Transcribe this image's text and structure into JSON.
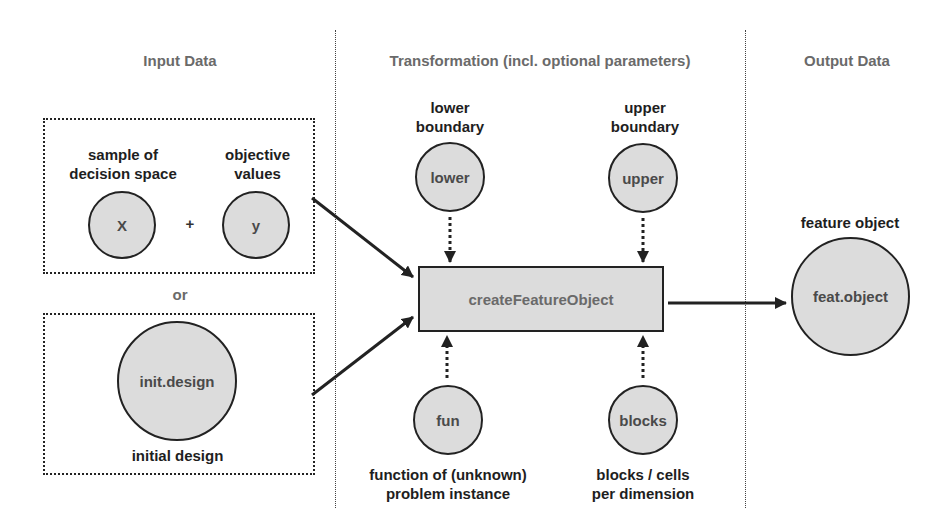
{
  "columns": {
    "input": {
      "heading": "Input Data"
    },
    "transformation": {
      "heading": "Transformation (incl. optional parameters)"
    },
    "output": {
      "heading": "Output Data"
    }
  },
  "input": {
    "option_a": {
      "x_label": "sample of\ndecision space",
      "x_node": "X",
      "plus": "+",
      "y_label": "objective\nvalues",
      "y_node": "y"
    },
    "or_label": "or",
    "option_b": {
      "node": "init.design",
      "label": "initial design"
    }
  },
  "transformation": {
    "function_box": "createFeatureObject",
    "params": {
      "lower": {
        "label": "lower\nboundary",
        "node": "lower"
      },
      "upper": {
        "label": "upper\nboundary",
        "node": "upper"
      },
      "fun": {
        "label": "function of (unknown)\nproblem instance",
        "node": "fun"
      },
      "blocks": {
        "label": "blocks / cells\nper dimension",
        "node": "blocks"
      }
    }
  },
  "output": {
    "label": "feature object",
    "node": "feat.object"
  },
  "colors": {
    "node_fill": "#dcdcdc",
    "stroke": "#222222",
    "heading_text": "#6a6a6a",
    "label_text": "#1e1e1e"
  }
}
